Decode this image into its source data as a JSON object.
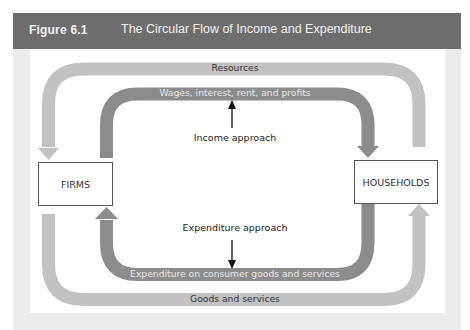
{
  "figure": {
    "label": "Figure 6.1",
    "title": "The Circular Flow of Income and Expenditure",
    "header_color": "#6d6d6d"
  },
  "nodes": {
    "left": "FIRMS",
    "right": "HOUSEHOLDS"
  },
  "flows": {
    "outer_top": "Resources",
    "inner_top": "Wages, interest, rent, and profits",
    "inner_bottom": "Expenditure on consumer goods and services",
    "outer_bottom": "Goods and services"
  },
  "annotations": {
    "income": "Income approach",
    "expenditure": "Expenditure approach"
  },
  "colors": {
    "outer_loop": "#c2c2c2",
    "inner_loop": "#8c8c8c"
  }
}
